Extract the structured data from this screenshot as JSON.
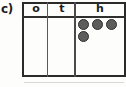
{
  "worksheet": {
    "item_label": "c)",
    "type": "place-value-chart"
  },
  "table": {
    "headers": [
      {
        "key": "ones",
        "label": "o"
      },
      {
        "key": "tens",
        "label": "t"
      },
      {
        "key": "hundreds",
        "label": "h"
      }
    ],
    "counters": {
      "ones": 0,
      "tens": 0,
      "hundreds": 4
    },
    "counter_rows": [
      {
        "count": 3
      },
      {
        "count": 1
      }
    ],
    "counter_color": "#5d5d5d",
    "counter_outline_color": "#2e2e2e",
    "border_color": "#2a2a2a"
  }
}
